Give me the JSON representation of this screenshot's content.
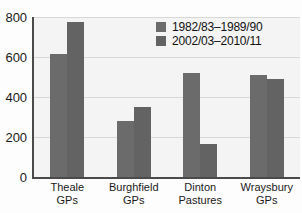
{
  "chart_data": {
    "type": "bar",
    "title": "",
    "xlabel": "",
    "ylabel": "",
    "ylim": [
      0,
      800
    ],
    "yticks": [
      0,
      200,
      400,
      600,
      800
    ],
    "grid": true,
    "legend_position": "top-right",
    "categories": [
      "Theale\nGPs",
      "Burghfield\nGPs",
      "Dinton\nPastures",
      "Wraysbury\nGPs"
    ],
    "category_lines": [
      [
        "Theale",
        "GPs"
      ],
      [
        "Burghfield",
        "GPs"
      ],
      [
        "Dinton",
        "Pastures"
      ],
      [
        "Wraysbury",
        "GPs"
      ]
    ],
    "series": [
      {
        "name": "1982/83–1989/90",
        "color": "#6b6b6b",
        "values": [
          615,
          280,
          520,
          510
        ]
      },
      {
        "name": "2002/03–2010/11",
        "color": "#636363",
        "values": [
          775,
          350,
          165,
          490
        ]
      }
    ]
  },
  "axes": {
    "y_tick_labels": [
      "800",
      "600",
      "400",
      "200",
      "0"
    ]
  },
  "legend": {
    "items": [
      {
        "label": "1982/83–1989/90"
      },
      {
        "label": "2002/03–2010/11"
      }
    ]
  },
  "colors": {
    "series_a": "#6b6b6b",
    "series_b": "#636363",
    "plot_background": "#f4f4f4",
    "axis": "#4a4a4a",
    "gridline": "#d8d8d8",
    "text": "#1a1a1a"
  }
}
